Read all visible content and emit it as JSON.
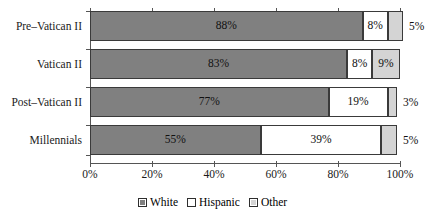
{
  "chart_data": {
    "type": "bar",
    "orientation": "horizontal",
    "stacked": true,
    "title": "",
    "subtitle": "",
    "xlabel": "",
    "ylabel": "",
    "xlim": [
      0,
      100
    ],
    "grid": false,
    "legend_position": "bottom",
    "categories": [
      "Pre–Vatican II",
      "Vatican II",
      "Post–Vatican II",
      "Millennials"
    ],
    "xticks": [
      "0%",
      "20%",
      "40%",
      "60%",
      "80%",
      "100%"
    ],
    "xtick_values": [
      0,
      20,
      40,
      60,
      80,
      100
    ],
    "series": [
      {
        "name": "White",
        "color": "#808080",
        "values": [
          88,
          83,
          77,
          55
        ],
        "labels": [
          "88%",
          "83%",
          "77%",
          "55%"
        ],
        "label_position": [
          "inside",
          "inside",
          "inside",
          "inside"
        ]
      },
      {
        "name": "Hispanic",
        "color": "#ffffff",
        "values": [
          8,
          8,
          19,
          39
        ],
        "labels": [
          "8%",
          "8%",
          "19%",
          "39%"
        ],
        "label_position": [
          "inside",
          "inside",
          "inside",
          "inside"
        ]
      },
      {
        "name": "Other",
        "color": "#d4d4d4",
        "values": [
          5,
          9,
          3,
          5
        ],
        "labels": [
          "5%",
          "9%",
          "3%",
          "5%"
        ],
        "label_position": [
          "outside",
          "inside",
          "outside",
          "outside"
        ]
      }
    ]
  },
  "legend": {
    "items": [
      {
        "label": "White",
        "color": "#808080"
      },
      {
        "label": "Hispanic",
        "color": "#ffffff"
      },
      {
        "label": "Other",
        "color": "#d4d4d4"
      }
    ]
  },
  "colors": {
    "white_series": "#808080",
    "hispanic_series": "#ffffff",
    "other_series": "#d4d4d4",
    "axis": "#555555",
    "bar_border": "#3a3a3a",
    "text": "#111111",
    "background": "#ffffff"
  }
}
